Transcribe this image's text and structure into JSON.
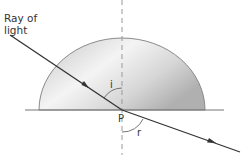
{
  "diagram": {
    "labels": {
      "ray": [
        "Ray of",
        "light"
      ],
      "point": "P",
      "incidence_angle": "i",
      "refraction_angle": "r"
    },
    "elements": {
      "block": "semicircular glass block",
      "normal": "dashed normal line through P",
      "incident_ray": "ray entering from upper left toward P",
      "refracted_ray": "ray leaving P toward lower right"
    },
    "colors": {
      "ray": "#333333",
      "normal": "#999999",
      "block_edge": "#888888",
      "block_fill_light": "#f4f4f4",
      "block_fill_dark": "#b9b9b9",
      "baseline": "#777777"
    }
  }
}
